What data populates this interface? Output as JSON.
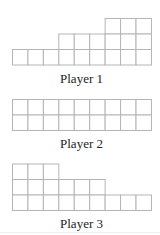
{
  "figure": {
    "cell_width": 15.44,
    "cell_height": 15.5,
    "grid_left": 12,
    "line_color": "#b5b5b5",
    "players": [
      {
        "label": "Player 1",
        "grid_top": 18,
        "label_top": 72,
        "rows_top_to_bottom": [
          {
            "start_col": 7,
            "end_col": 9
          },
          {
            "start_col": 4,
            "end_col": 9
          },
          {
            "start_col": 1,
            "end_col": 9
          }
        ]
      },
      {
        "label": "Player 2",
        "grid_top": 99,
        "label_top": 137,
        "rows_top_to_bottom": [
          {
            "start_col": 1,
            "end_col": 9
          },
          {
            "start_col": 1,
            "end_col": 9
          }
        ]
      },
      {
        "label": "Player 3",
        "grid_top": 163.5,
        "label_top": 217,
        "rows_top_to_bottom": [
          {
            "start_col": 1,
            "end_col": 3
          },
          {
            "start_col": 1,
            "end_col": 6
          },
          {
            "start_col": 1,
            "end_col": 9
          }
        ]
      }
    ]
  }
}
